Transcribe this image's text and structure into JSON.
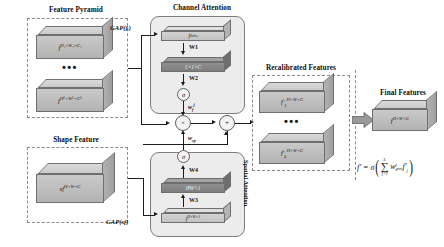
{
  "diagram": {
    "sections": {
      "feature_pyramid": {
        "title": "Feature Pyramid",
        "blocks": [
          {
            "name": "f",
            "sup": "H₁×W₁×C₁"
          },
          {
            "name": "f",
            "sup": "Hᴸ×Wᴸ×Cᴸ"
          }
        ],
        "ellipsis": "•••"
      },
      "shape_feature": {
        "title": "Shape Feature",
        "block": {
          "name": "sf",
          "sup": "H×W×C"
        }
      },
      "channel_attention": {
        "title": "Channel Attention",
        "input_label": "GAP(fᵢ)",
        "slab_top": "f¹ˣ¹ˣᶜ",
        "slab_top_plain": "1×1×C",
        "slab_bottom": "1×1×C",
        "weight1": "W1",
        "weight2": "W2",
        "sigma": "σ",
        "output_label": "w",
        "output_sub": "f",
        "output_sup": "j"
      },
      "spatial_attention": {
        "title": "Spatial Attention",
        "input_label": "GAP(sf)",
        "slab_bottom": "f",
        "slab_bottom_sup": "H×W×1",
        "slab_top": "HW×1",
        "weight3": "W3",
        "weight4": "W4",
        "sigma": "σ",
        "output_label": "w",
        "output_sub": "sp"
      },
      "recalibrated": {
        "title": "Recalibrated Features",
        "blocks": [
          {
            "name": "f′",
            "sub": "1",
            "sup": "H×W×C"
          },
          {
            "name": "f′",
            "sub": "L",
            "sup": "H×W×C"
          }
        ],
        "ellipsis": "•••"
      },
      "final": {
        "title": "Final Features",
        "block": {
          "name": "f",
          "sup": "H×W×C"
        },
        "formula": {
          "lhs": "f′",
          "eq": "=",
          "sigma": "σ",
          "sum_upper": "L",
          "sum_symbol": "∑",
          "sum_lower": "j=1",
          "weight": "w",
          "weight_sub": "grm",
          "weight_sup": "j",
          "term": "f′",
          "term_sub": "j"
        }
      }
    },
    "operators": {
      "multiply": "×",
      "add": "+"
    }
  }
}
